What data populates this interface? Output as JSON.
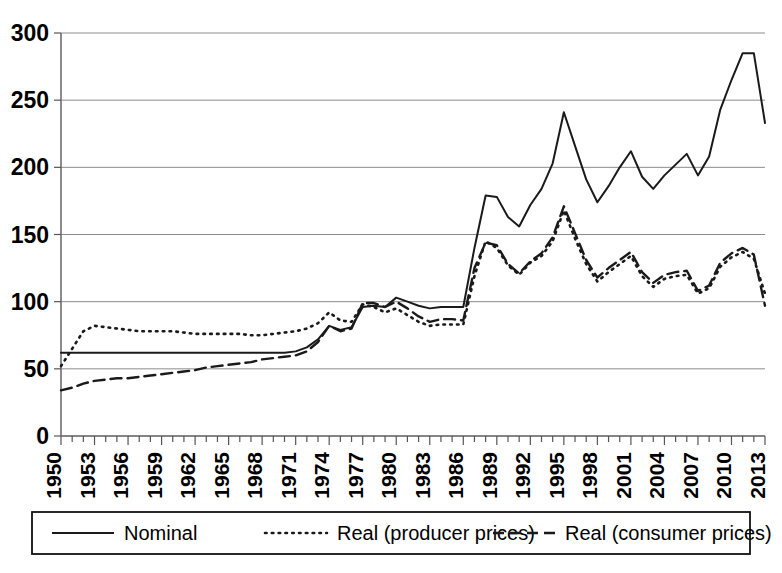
{
  "chart_data": {
    "type": "line",
    "title": "",
    "subtitle": "",
    "xlabel": "",
    "ylabel": "",
    "xlim": [
      1950,
      2013
    ],
    "ylim": [
      0,
      300
    ],
    "yticks": [
      0,
      50,
      100,
      150,
      200,
      250,
      300
    ],
    "ytick_labels": [
      "0",
      "50",
      "100",
      "150",
      "200",
      "250",
      "300"
    ],
    "grid": true,
    "grid_axis": "y",
    "legend_position": "bottom",
    "minor_tick_every": 1,
    "x": [
      1950,
      1951,
      1952,
      1953,
      1954,
      1955,
      1956,
      1957,
      1958,
      1959,
      1960,
      1961,
      1962,
      1963,
      1964,
      1965,
      1966,
      1967,
      1968,
      1969,
      1970,
      1971,
      1972,
      1973,
      1974,
      1975,
      1976,
      1977,
      1978,
      1979,
      1980,
      1981,
      1982,
      1983,
      1984,
      1985,
      1986,
      1987,
      1988,
      1989,
      1990,
      1991,
      1992,
      1993,
      1994,
      1995,
      1996,
      1997,
      1998,
      1999,
      2000,
      2001,
      2002,
      2003,
      2004,
      2005,
      2006,
      2007,
      2008,
      2009,
      2010,
      2011,
      2012,
      2013
    ],
    "xtick_labels": [
      "1950",
      "1953",
      "1956",
      "1959",
      "1962",
      "1965",
      "1968",
      "1971",
      "1974",
      "1977",
      "1980",
      "1983",
      "1986",
      "1989",
      "1992",
      "1995",
      "1998",
      "2001",
      "2004",
      "2007",
      "2010",
      "2013"
    ],
    "xtick_values": [
      1950,
      1953,
      1956,
      1959,
      1962,
      1965,
      1968,
      1971,
      1974,
      1977,
      1980,
      1983,
      1986,
      1989,
      1992,
      1995,
      1998,
      2001,
      2004,
      2007,
      2010,
      2013
    ],
    "series": [
      {
        "name": "Nominal",
        "style": "solid",
        "color": "#1a1a1a",
        "values": [
          62,
          62,
          62,
          62,
          62,
          62,
          62,
          62,
          62,
          62,
          62,
          62,
          62,
          62,
          62,
          62,
          62,
          62,
          62,
          62,
          62,
          63,
          66,
          72,
          82,
          79,
          81,
          96,
          97,
          96,
          103,
          100,
          97,
          95,
          96,
          96,
          96,
          140,
          179,
          178,
          163,
          156,
          172,
          184,
          203,
          241,
          216,
          191,
          174,
          186,
          200,
          212,
          193,
          184,
          194,
          202,
          210,
          194,
          208,
          243,
          265,
          285,
          285,
          233
        ]
      },
      {
        "name": "Real (producer prices)",
        "style": "dotted",
        "color": "#1a1a1a",
        "values": [
          52,
          65,
          78,
          82,
          81,
          80,
          79,
          78,
          78,
          78,
          78,
          77,
          76,
          76,
          76,
          76,
          76,
          75,
          75,
          76,
          77,
          78,
          80,
          84,
          92,
          86,
          85,
          98,
          96,
          92,
          95,
          90,
          85,
          82,
          83,
          83,
          83,
          119,
          145,
          140,
          127,
          120,
          129,
          134,
          145,
          168,
          147,
          128,
          115,
          122,
          128,
          134,
          119,
          111,
          117,
          119,
          120,
          106,
          110,
          126,
          133,
          137,
          132,
          106
        ]
      },
      {
        "name": "Real (consumer prices)",
        "style": "dashed",
        "color": "#1a1a1a",
        "values": [
          34,
          36,
          39,
          41,
          42,
          43,
          43,
          44,
          45,
          46,
          47,
          48,
          49,
          51,
          52,
          53,
          54,
          55,
          57,
          58,
          59,
          60,
          63,
          70,
          82,
          78,
          80,
          99,
          99,
          96,
          100,
          95,
          89,
          85,
          87,
          87,
          86,
          125,
          144,
          142,
          128,
          121,
          130,
          136,
          148,
          171,
          151,
          131,
          118,
          125,
          131,
          137,
          122,
          114,
          120,
          122,
          123,
          108,
          112,
          129,
          136,
          140,
          135,
          97
        ]
      }
    ],
    "legend": [
      {
        "label": "Nominal",
        "style": "solid"
      },
      {
        "label": "Real (producer prices)",
        "style": "dotted"
      },
      {
        "label": "Real (consumer prices)",
        "style": "dashed"
      }
    ]
  }
}
